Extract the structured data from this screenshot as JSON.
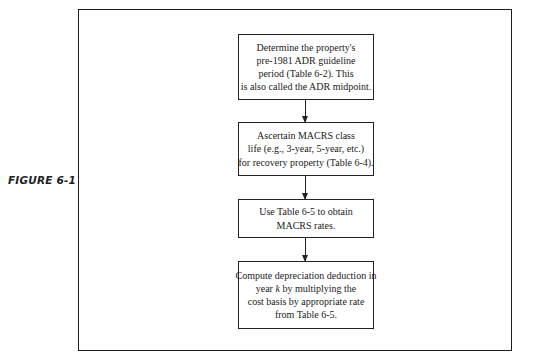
{
  "figure": {
    "label": "FIGURE 6-1"
  },
  "flowchart": {
    "steps": [
      {
        "lines": [
          "Determine the property's",
          "pre-1981 ADR guideline",
          "period (Table 6-2). This",
          "is also called the ADR midpoint."
        ]
      },
      {
        "lines": [
          "Ascertain MACRS class",
          "life (e.g., 3-year, 5-year, etc.)",
          "for recovery property (Table 6-4)."
        ]
      },
      {
        "lines": [
          "Use Table 6-5 to obtain",
          "MACRS rates."
        ]
      },
      {
        "lines": [
          "Compute depreciation deduction in",
          "year",
          "k",
          "by multiplying the",
          "cost basis by appropriate rate",
          "from Table 6-5."
        ]
      }
    ],
    "arrows": [
      {
        "from": 1,
        "to": 2
      },
      {
        "from": 2,
        "to": 3
      },
      {
        "from": 3,
        "to": 4
      }
    ]
  },
  "caption": {
    "cut_off_text": ""
  }
}
